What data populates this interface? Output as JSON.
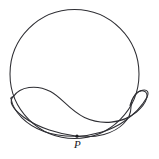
{
  "figure": {
    "kind": "geometry-diagram",
    "background_color": "#ffffff",
    "stroke_color": "#2e2e33",
    "stroke_width": 1.05,
    "canvas": {
      "width": 159,
      "height": 159
    },
    "labels": [
      {
        "id": "point-p",
        "text": "P",
        "style": "italic-serif",
        "color": "#17171b",
        "x": 74,
        "y": 139
      }
    ],
    "points": [
      {
        "id": "p",
        "name": "P",
        "x": 77,
        "y": 136.2,
        "radius": 1.6,
        "color": "#1d1d21"
      }
    ],
    "curves": [
      {
        "id": "circle",
        "name": "outer-circle",
        "type": "circle",
        "cx": 74.5,
        "cy": 74.0,
        "r": 64.5
      },
      {
        "id": "bean-outer",
        "name": "bean-curve-outer-lobe",
        "type": "path",
        "d": "M 13.5 96.4 C 20.0 86.8 36.0 84.0 50.5 91.5 C 62.0 97.5 69.5 110.5 84.5 117.5 C 101.0 125.2 122.0 124.0 136.5 112.0 C 147.5 102.8 150.0 92.6 143.5 91.0 C 137.5 89.6 131.0 97.0 131.0 107.0 C 131.0 119.5 120.0 130.0 104.0 134.5 C 93.5 137.4 83.5 137.0 77.0 136.2 C 60.0 134.2 38.0 128.0 23.5 117.0 C 11.5 108.0 8.5 101.0 13.5 96.4 Z"
      },
      {
        "id": "bean-inner",
        "name": "bean-curve-inner-lobe",
        "type": "path",
        "d": "M 11.0 98.5 C 13.5 112.5 26.5 125.0 44.0 131.5 C 56.0 135.9 68.0 136.4 77.0 136.2 C 92.0 135.8 110.5 131.0 124.0 121.5 C 136.0 113.0 143.0 104.5 146.8 97.5"
      },
      {
        "id": "bean-right-tail",
        "name": "bean-curve-right-tail",
        "type": "path",
        "d": "M 146.8 97.5 C 149.5 92.2 147.5 89.3 142.5 90.2 C 137.0 91.2 132.0 97.5 130.0 105.5"
      },
      {
        "id": "bean-left-tail",
        "name": "bean-curve-left-tail",
        "type": "path",
        "d": "M 13.5 96.4 C 11.5 96.9 10.6 97.6 11.0 98.5"
      }
    ]
  }
}
